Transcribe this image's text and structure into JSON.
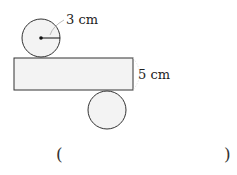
{
  "diagram": {
    "radius_label": "3 cm",
    "height_label": "5 cm",
    "answer_open": "(",
    "answer_close": ")",
    "fill_color": "#f3f3f3",
    "stroke_color": "#333333",
    "dimension_line_color": "#bbbbbb"
  }
}
